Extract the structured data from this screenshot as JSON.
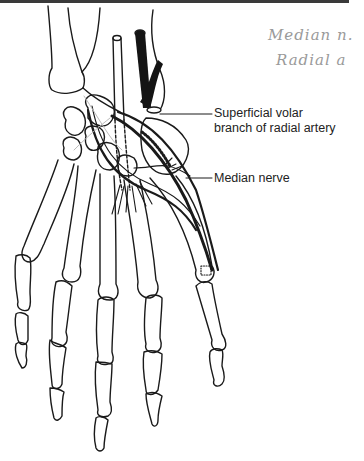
{
  "figure": {
    "labels": {
      "artery": [
        "Superficial volar",
        "branch of radial artery"
      ],
      "nerve": "Median nerve"
    },
    "handwritten_notes": [
      "Median n.",
      "Radial a"
    ],
    "colors": {
      "ink": "#1a1a1a",
      "artery_fill": "#141414",
      "note_gray": "#9a9a9a",
      "top_bar": "#3a3a3a"
    }
  }
}
